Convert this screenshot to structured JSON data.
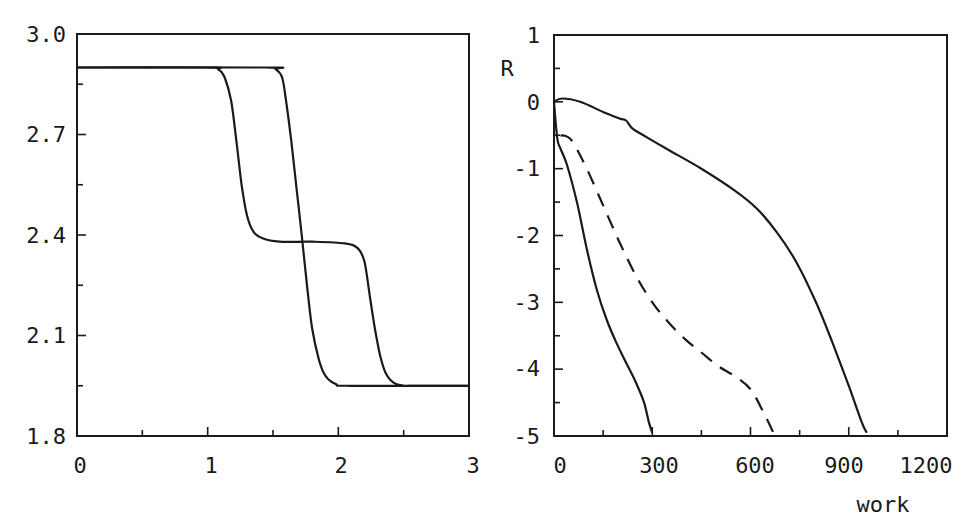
{
  "chart_data": [
    {
      "type": "line",
      "title": "",
      "xlabel": "",
      "ylabel": "",
      "xlim": [
        0,
        3
      ],
      "ylim": [
        1.8,
        3.0
      ],
      "grid": false,
      "legend": null,
      "x_ticks": [
        "0",
        "1",
        "2",
        "3"
      ],
      "y_ticks": [
        "1.8",
        "2.1",
        "2.4",
        "2.7",
        "3.0"
      ],
      "series": [
        {
          "name": "two-step profile",
          "style": "solid",
          "x": [
            0,
            1.0,
            1.08,
            1.13,
            1.18,
            1.22,
            1.26,
            1.3,
            1.35,
            1.42,
            1.55,
            1.8,
            2.05,
            2.15,
            2.2,
            2.24,
            2.28,
            2.32,
            2.36,
            2.42,
            2.5,
            2.6,
            3.0
          ],
          "y": [
            2.9,
            2.9,
            2.895,
            2.87,
            2.8,
            2.68,
            2.55,
            2.46,
            2.41,
            2.39,
            2.38,
            2.38,
            2.375,
            2.36,
            2.32,
            2.22,
            2.12,
            2.04,
            1.99,
            1.96,
            1.95,
            1.95,
            1.95
          ]
        },
        {
          "name": "single-step profile",
          "style": "solid",
          "x": [
            0,
            1.45,
            1.52,
            1.57,
            1.6,
            1.64,
            1.68,
            1.72,
            1.76,
            1.8,
            1.85,
            1.9,
            1.98,
            2.1,
            3.0
          ],
          "y": [
            2.9,
            2.9,
            2.895,
            2.87,
            2.8,
            2.68,
            2.54,
            2.4,
            2.25,
            2.12,
            2.03,
            1.98,
            1.955,
            1.95,
            1.95
          ]
        }
      ]
    },
    {
      "type": "line",
      "title": "",
      "xlabel": "work",
      "ylabel": "R",
      "xlim": [
        0,
        1200
      ],
      "ylim": [
        -5,
        1
      ],
      "grid": false,
      "legend": null,
      "x_ticks": [
        "0",
        "300",
        "600",
        "900",
        "1200"
      ],
      "y_ticks": [
        "-5",
        "-4",
        "-3",
        "-2",
        "-1",
        "0",
        "1"
      ],
      "series": [
        {
          "name": "solid short",
          "style": "solid",
          "x": [
            0,
            10,
            20,
            40,
            70,
            100,
            130,
            160,
            190,
            220,
            250,
            275,
            290,
            300
          ],
          "y": [
            0,
            -0.55,
            -0.7,
            -0.95,
            -1.5,
            -2.2,
            -2.8,
            -3.25,
            -3.6,
            -3.9,
            -4.2,
            -4.5,
            -4.8,
            -4.95
          ]
        },
        {
          "name": "dashed",
          "style": "dashed",
          "x": [
            20,
            40,
            60,
            100,
            150,
            200,
            250,
            300,
            350,
            400,
            450,
            500,
            550,
            600,
            640,
            670
          ],
          "y": [
            -0.5,
            -0.52,
            -0.62,
            -1.0,
            -1.55,
            -2.1,
            -2.6,
            -3.0,
            -3.3,
            -3.55,
            -3.75,
            -3.95,
            -4.1,
            -4.3,
            -4.65,
            -4.95
          ]
        },
        {
          "name": "solid long",
          "style": "solid",
          "x": [
            0,
            25,
            80,
            150,
            200,
            220,
            240,
            280,
            350,
            450,
            550,
            620,
            680,
            740,
            800,
            850,
            900,
            940,
            955
          ],
          "y": [
            0,
            0.05,
            0.0,
            -0.15,
            -0.25,
            -0.28,
            -0.4,
            -0.52,
            -0.72,
            -1.0,
            -1.32,
            -1.6,
            -1.95,
            -2.4,
            -3.0,
            -3.6,
            -4.25,
            -4.8,
            -4.95
          ]
        }
      ]
    }
  ],
  "labels": {
    "left": {
      "y_ticks": [
        "3.0",
        "2.7",
        "2.4",
        "2.1",
        "1.8"
      ],
      "x_ticks": [
        "0",
        "1",
        "2",
        "3"
      ]
    },
    "right": {
      "y_ticks": [
        "1",
        "0",
        "-1",
        "-2",
        "-3",
        "-4",
        "-5"
      ],
      "x_ticks": [
        "0",
        "300",
        "600",
        "900",
        "1200"
      ],
      "ylabel": "R",
      "xlabel": "work"
    }
  },
  "colors": {
    "line": "#1a1a1a",
    "background": "#ffffff"
  }
}
